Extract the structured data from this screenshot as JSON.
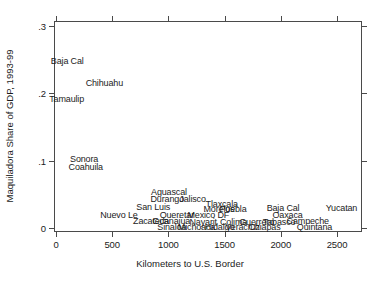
{
  "chart_data": {
    "type": "scatter",
    "title": "",
    "xlabel": "Kilometers to U.S. Border",
    "ylabel": "Maquiladora Share of GDP, 1993-99",
    "xlim": [
      0,
      2650
    ],
    "ylim": [
      0,
      0.315
    ],
    "xticks": [
      0,
      500,
      1000,
      1500,
      2000,
      2500
    ],
    "xticklabels": [
      "0",
      "500",
      "1000",
      "1500",
      "2000",
      "2500"
    ],
    "yticks": [
      0,
      0.1,
      0.2,
      0.3
    ],
    "yticklabels": [
      "0",
      ".1",
      ".2",
      ".3"
    ],
    "grid": false,
    "legend": null,
    "marker_style": "text-labels-only",
    "points": [
      {
        "label": "Baja Cal",
        "x": 100,
        "y": 0.248
      },
      {
        "label": "Chihuahu",
        "x": 430,
        "y": 0.215
      },
      {
        "label": "Tamaulip",
        "x": 95,
        "y": 0.192
      },
      {
        "label": "Sonora",
        "x": 250,
        "y": 0.103
      },
      {
        "label": "Coahuila",
        "x": 265,
        "y": 0.09
      },
      {
        "label": "Aguascal",
        "x": 1005,
        "y": 0.054
      },
      {
        "label": "Durango",
        "x": 990,
        "y": 0.043
      },
      {
        "label": "Jalisco",
        "x": 1215,
        "y": 0.043
      },
      {
        "label": "Tlaxcala",
        "x": 1475,
        "y": 0.036
      },
      {
        "label": "San Luis",
        "x": 865,
        "y": 0.031
      },
      {
        "label": "Morelos",
        "x": 1450,
        "y": 0.028
      },
      {
        "label": "Puebla",
        "x": 1575,
        "y": 0.028
      },
      {
        "label": "Baja Cal",
        "x": 2020,
        "y": 0.03
      },
      {
        "label": "Yucatan",
        "x": 2540,
        "y": 0.03
      },
      {
        "label": "Nuevo Le",
        "x": 560,
        "y": 0.019
      },
      {
        "label": "Queretar",
        "x": 1075,
        "y": 0.019
      },
      {
        "label": "Mexico DF",
        "x": 1355,
        "y": 0.019
      },
      {
        "label": "Oaxaca",
        "x": 2060,
        "y": 0.019
      },
      {
        "label": "Zacateca",
        "x": 845,
        "y": 0.01
      },
      {
        "label": "Guanajua",
        "x": 1025,
        "y": 0.01
      },
      {
        "label": "Nayarit",
        "x": 1310,
        "y": 0.009
      },
      {
        "label": "Colima",
        "x": 1580,
        "y": 0.009
      },
      {
        "label": "Guerrero",
        "x": 1785,
        "y": 0.009
      },
      {
        "label": "Tabasco",
        "x": 1985,
        "y": 0.009
      },
      {
        "label": "Campeche",
        "x": 2240,
        "y": 0.01
      },
      {
        "label": "Sinaloa",
        "x": 1030,
        "y": 0.001
      },
      {
        "label": "Michoaca",
        "x": 1250,
        "y": 0.001
      },
      {
        "label": "Hidalgo",
        "x": 1455,
        "y": 0.001
      },
      {
        "label": "Veracruz",
        "x": 1660,
        "y": 0.001
      },
      {
        "label": "Chiapas",
        "x": 1855,
        "y": 0.001
      },
      {
        "label": "Quintana",
        "x": 2300,
        "y": 0.001
      }
    ]
  }
}
